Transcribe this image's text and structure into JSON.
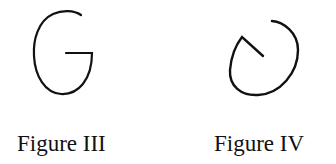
{
  "figures": [
    {
      "id": "figure-iii",
      "label": "Figure III",
      "shape": "G-like open curve with horizontal inward bar",
      "stroke_color": "#111111"
    },
    {
      "id": "figure-iv",
      "label": "Figure IV",
      "shape": "open loop curve with diagonal inward segment",
      "stroke_color": "#111111"
    }
  ]
}
